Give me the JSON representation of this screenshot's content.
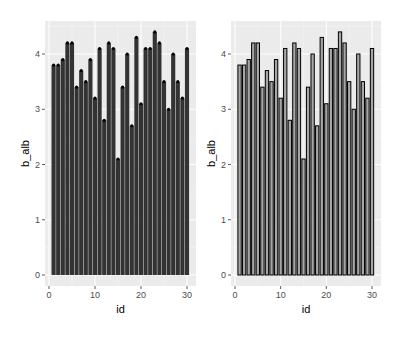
{
  "chart_data": [
    {
      "type": "bar",
      "variant": "filled-dark-with-points",
      "xlabel": "id",
      "ylabel": "b_alb",
      "x": [
        1,
        2,
        3,
        4,
        5,
        6,
        7,
        8,
        9,
        10,
        11,
        12,
        13,
        14,
        15,
        16,
        17,
        18,
        19,
        20,
        21,
        22,
        23,
        24,
        25,
        26,
        27,
        28,
        29,
        30
      ],
      "values": [
        3.8,
        3.8,
        3.9,
        4.2,
        4.2,
        3.4,
        3.7,
        3.5,
        3.9,
        3.2,
        4.1,
        2.8,
        4.2,
        4.1,
        2.1,
        3.4,
        4.0,
        2.7,
        4.3,
        3.1,
        4.1,
        4.1,
        4.4,
        4.2,
        3.5,
        3.0,
        4.0,
        3.5,
        3.2,
        4.1
      ],
      "xticks": [
        "0",
        "10",
        "20",
        "30"
      ],
      "yticks": [
        "0",
        "1",
        "2",
        "3",
        "4"
      ],
      "xlim": [
        -0.5,
        31.5
      ],
      "ylim": [
        -0.22,
        4.62
      ],
      "grid": true,
      "fill_color": "#333333",
      "point_color": "#000000",
      "panel_bg": "#ebebeb"
    },
    {
      "type": "bar",
      "variant": "outlined-gray",
      "xlabel": "id",
      "ylabel": "b_alb",
      "x": [
        1,
        2,
        3,
        4,
        5,
        6,
        7,
        8,
        9,
        10,
        11,
        12,
        13,
        14,
        15,
        16,
        17,
        18,
        19,
        20,
        21,
        22,
        23,
        24,
        25,
        26,
        27,
        28,
        29,
        30
      ],
      "values": [
        3.8,
        3.8,
        3.9,
        4.2,
        4.2,
        3.4,
        3.7,
        3.5,
        3.9,
        3.2,
        4.1,
        2.8,
        4.2,
        4.1,
        2.1,
        3.4,
        4.0,
        2.7,
        4.3,
        3.1,
        4.1,
        4.1,
        4.4,
        4.2,
        3.5,
        3.0,
        4.0,
        3.5,
        3.2,
        4.1
      ],
      "xticks": [
        "0",
        "10",
        "20",
        "30"
      ],
      "yticks": [
        "0",
        "1",
        "2",
        "3",
        "4"
      ],
      "xlim": [
        -0.5,
        31.5
      ],
      "ylim": [
        -0.22,
        4.62
      ],
      "grid": true,
      "fill_color": "#a6a6a6",
      "outline_color": "#000000",
      "panel_bg": "#ebebeb"
    }
  ],
  "panels": [
    {
      "xlabel": "id",
      "ylabel": "b_alb"
    },
    {
      "xlabel": "id",
      "ylabel": "b_alb"
    }
  ]
}
